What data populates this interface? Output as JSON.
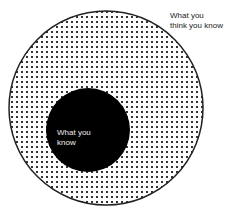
{
  "diagram": {
    "outer_circle": {
      "label_line1": "What you",
      "label_line2": "think you know",
      "fill": "dotted",
      "stroke": "#222222"
    },
    "inner_circle": {
      "label_line1": "What you",
      "label_line2": "know",
      "fill": "#000000"
    }
  }
}
